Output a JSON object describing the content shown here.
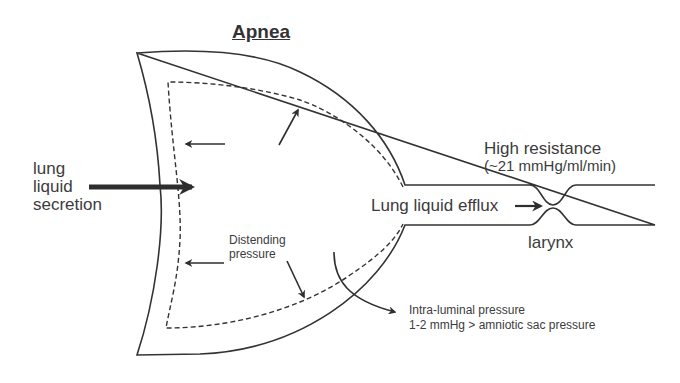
{
  "diagram": {
    "title": "Apnea",
    "labels": {
      "lung_liquid_secretion": [
        "lung",
        "liquid",
        "secretion"
      ],
      "high_resistance": "High resistance",
      "resistance_value": "(~21 mmHg/ml/min)",
      "lung_liquid_efflux": "Lung liquid efflux",
      "larynx": "larynx",
      "distending_pressure": [
        "Distending",
        "pressure"
      ],
      "intraluminal_pressure": "Intra-luminal pressure",
      "pressure_comparison": "1-2 mmHg > amniotic sac pressure"
    },
    "elements": {
      "lung_outline": "solid outer lung wall",
      "lung_inner_boundary": "dashed inner boundary",
      "trachea": "tube leading to larynx",
      "larynx_constriction": "narrowing at larynx",
      "arrows": [
        {
          "name": "secretion-arrow",
          "direction": "right",
          "style": "bold"
        },
        {
          "name": "distending-arrow-upper-left",
          "direction": "left"
        },
        {
          "name": "distending-arrow-upper-right",
          "direction": "up-right"
        },
        {
          "name": "distending-arrow-lower-left",
          "direction": "left"
        },
        {
          "name": "distending-arrow-lower-right",
          "direction": "down-right"
        },
        {
          "name": "efflux-arrow",
          "direction": "right"
        },
        {
          "name": "intraluminal-curved-arrow",
          "direction": "curved-right"
        }
      ]
    },
    "colors": {
      "line": "#333333",
      "text": "#3c3c3c",
      "background": "#ffffff"
    }
  }
}
